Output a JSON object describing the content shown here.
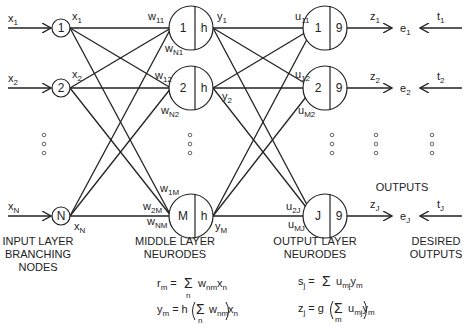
{
  "diagram": {
    "inputs": [
      {
        "label": "x",
        "sub": "1",
        "node": "1",
        "out_label": "x",
        "out_sub": "1"
      },
      {
        "label": "x",
        "sub": "2",
        "node": "2",
        "out_label": "x",
        "out_sub": "2"
      },
      {
        "label": "x",
        "sub": "N",
        "node": "N",
        "out_label": "x",
        "out_sub": "N"
      }
    ],
    "middle": [
      {
        "node": "1",
        "fn": "h",
        "y": "y",
        "y_sub": "1",
        "w_top": "w",
        "w_top_sub": "11",
        "w_bot": "w",
        "w_bot_sub": "N1"
      },
      {
        "node": "2",
        "fn": "h",
        "y": "y",
        "y_sub": "2",
        "w_top": "w",
        "w_top_sub": "12",
        "w_bot": "w",
        "w_bot_sub": "N2"
      },
      {
        "node": "M",
        "fn": "h",
        "y": "y",
        "y_sub": "M",
        "w_top": "w",
        "w_top_sub": "1M",
        "w_mid": "w",
        "w_mid_sub": "2M",
        "w_bot": "w",
        "w_bot_sub": "NM"
      }
    ],
    "output": [
      {
        "node": "1",
        "fn": "9",
        "u_top": "u",
        "u_top_sub": "11",
        "z": "z",
        "z_sub": "1",
        "e": "e",
        "e_sub": "1",
        "t": "t",
        "t_sub": "1"
      },
      {
        "node": "2",
        "fn": "9",
        "u_top": "u",
        "u_top_sub": "12",
        "u_bot": "u",
        "u_bot_sub": "M2",
        "z": "z",
        "z_sub": "2",
        "e": "e",
        "e_sub": "2",
        "t": "t",
        "t_sub": "2"
      },
      {
        "node": "J",
        "fn": "9",
        "u_top": "u",
        "u_top_sub": "2J",
        "u_bot": "u",
        "u_bot_sub": "MJ",
        "z": "z",
        "z_sub": "J",
        "e": "e",
        "e_sub": "J",
        "t": "t",
        "t_sub": "J"
      }
    ],
    "captions": {
      "input_layer": [
        "INPUT LAYER",
        "BRANCHING",
        "NODES"
      ],
      "middle_layer": [
        "MIDDLE LAYER",
        "NEURODES"
      ],
      "output_layer": [
        "OUTPUT LAYER",
        "NEURODES"
      ],
      "desired": [
        "DESIRED",
        "OUTPUTS"
      ],
      "outputs": "OUTPUTS"
    },
    "formulas": {
      "r_m": {
        "lhs": "r",
        "lhs_sub": "m",
        "eq": "=",
        "sum": "Σ",
        "sum_sub": "n",
        "term": "w",
        "term_sub": "nm",
        "term2": "x",
        "term2_sub": "n"
      },
      "y_m": {
        "lhs": "y",
        "lhs_sub": "m",
        "eq": "=",
        "fn": "h",
        "sum": "Σ",
        "sum_sub": "n",
        "term": "w",
        "term_sub": "nm",
        "term2": "x",
        "term2_sub": "n"
      },
      "s_j": {
        "lhs": "s",
        "lhs_sub": "j",
        "eq": "=",
        "sum": "Σ",
        "term": "u",
        "term_sub": "mj",
        "term2": "y",
        "term2_sub": "m"
      },
      "z_j": {
        "lhs": "z",
        "lhs_sub": "j",
        "eq": "=",
        "fn": "g",
        "sum": "Σ",
        "sum_sub": "m",
        "term": "u",
        "term_sub": "mj",
        "term2": "y",
        "term2_sub": "m"
      }
    },
    "ellipsis": "∘"
  }
}
